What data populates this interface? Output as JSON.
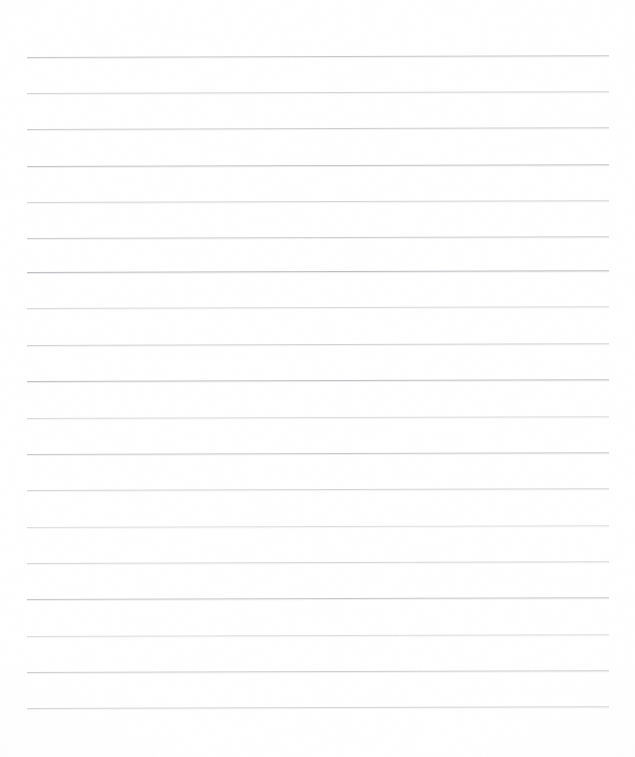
{
  "document": {
    "kind": "scanned-lined-paper",
    "title": "Lined Paper Scan",
    "page_width": 635,
    "page_height": 757,
    "background_color": "#ffffff",
    "text_content": "",
    "handwriting_present": "no",
    "margin_rule_present": "no"
  },
  "ruling": {
    "line_color": "#b9bcc0",
    "line_count": 19,
    "line_left_x": 27,
    "line_right_x": 609,
    "line_width": 582,
    "line_thickness_px": 1,
    "first_line_y": 57,
    "line_spacing_px": 36.2,
    "skew_degrees": -0.18,
    "lines": [
      {
        "index": 1,
        "y": 57,
        "opacity": 0.8
      },
      {
        "index": 2,
        "y": 93,
        "opacity": 0.62
      },
      {
        "index": 3,
        "y": 129,
        "opacity": 0.7
      },
      {
        "index": 4,
        "y": 166,
        "opacity": 0.85
      },
      {
        "index": 5,
        "y": 202,
        "opacity": 0.6
      },
      {
        "index": 6,
        "y": 238,
        "opacity": 0.72
      },
      {
        "index": 7,
        "y": 272,
        "opacity": 0.95
      },
      {
        "index": 8,
        "y": 308,
        "opacity": 0.55
      },
      {
        "index": 9,
        "y": 345,
        "opacity": 0.65
      },
      {
        "index": 10,
        "y": 381,
        "opacity": 0.9
      },
      {
        "index": 11,
        "y": 418,
        "opacity": 0.52
      },
      {
        "index": 12,
        "y": 454,
        "opacity": 0.78
      },
      {
        "index": 13,
        "y": 490,
        "opacity": 0.6
      },
      {
        "index": 14,
        "y": 527,
        "opacity": 0.48
      },
      {
        "index": 15,
        "y": 563,
        "opacity": 0.58
      },
      {
        "index": 16,
        "y": 599,
        "opacity": 0.8
      },
      {
        "index": 17,
        "y": 636,
        "opacity": 0.5
      },
      {
        "index": 18,
        "y": 672,
        "opacity": 0.7
      },
      {
        "index": 19,
        "y": 708,
        "opacity": 0.62
      }
    ]
  }
}
